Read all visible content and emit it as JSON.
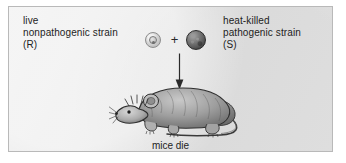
{
  "figure": {
    "panel_background": "#e4e4e4",
    "border_color": "#b9b9b9",
    "text_color": "#1d1d1d"
  },
  "labels": {
    "left": {
      "line1": "live",
      "line2": "nonpathogenic strain",
      "line3": "(R)"
    },
    "right": {
      "line1": "heat-killed",
      "line2": "pathogenic strain",
      "line3": "(S)"
    }
  },
  "operator": {
    "plus": "+"
  },
  "cells": {
    "r_strain": {
      "name": "rough-strain-cell",
      "fill": "#d3d3d3",
      "outline": "#8d8d8d"
    },
    "s_strain": {
      "name": "smooth-strain-cell",
      "fill": "#4a4a4a",
      "outline": "#2b2b2b"
    }
  },
  "arrow": {
    "direction": "down",
    "color": "#2a2a2a"
  },
  "mouse": {
    "alt": "mouse illustration facing left",
    "body_color": "#8c8c8c",
    "outline_color": "#2f2f2f"
  },
  "caption": {
    "text": "mice die"
  }
}
